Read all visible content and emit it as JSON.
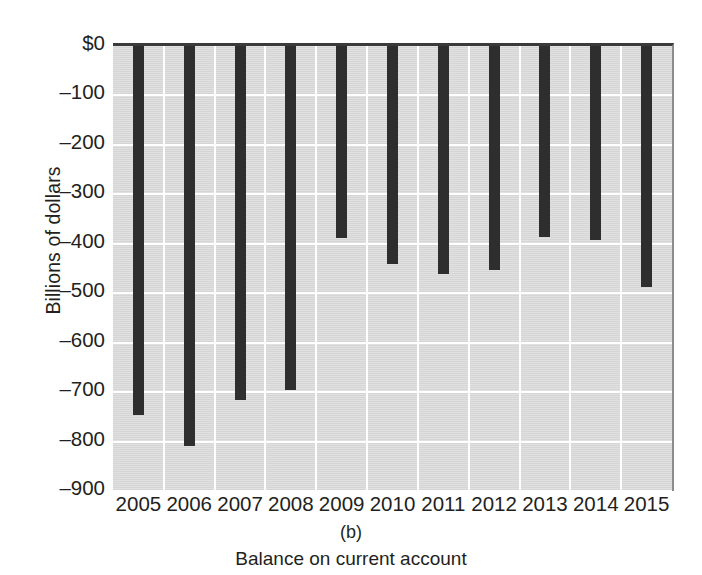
{
  "chart_data": {
    "type": "bar",
    "title": "",
    "subtitle": "",
    "panel_label": "(b)",
    "caption": "Balance on current account",
    "xlabel": "",
    "ylabel": "Billions of dollars",
    "categories": [
      "2005",
      "2006",
      "2007",
      "2008",
      "2009",
      "2010",
      "2011",
      "2012",
      "2013",
      "2014",
      "2015"
    ],
    "values": [
      -746,
      -809,
      -716,
      -696,
      -388,
      -441,
      -461,
      -453,
      -386,
      -392,
      -487
    ],
    "ylim": [
      -900,
      0
    ],
    "ytick_values": [
      0,
      -100,
      -200,
      -300,
      -400,
      -500,
      -600,
      -700,
      -800,
      -900
    ],
    "ytick_labels": [
      "$0",
      "–100",
      "–200",
      "–300",
      "–400",
      "–500",
      "–600",
      "–700",
      "–800",
      "–900"
    ],
    "grid": true,
    "grid_color": "#ffffff",
    "legend": false,
    "legend_position": "none",
    "bar_color": "#2e2e2e",
    "plot_background": "#d9d9d9",
    "page_background": "#ffffff",
    "text_color": "#231f20"
  }
}
